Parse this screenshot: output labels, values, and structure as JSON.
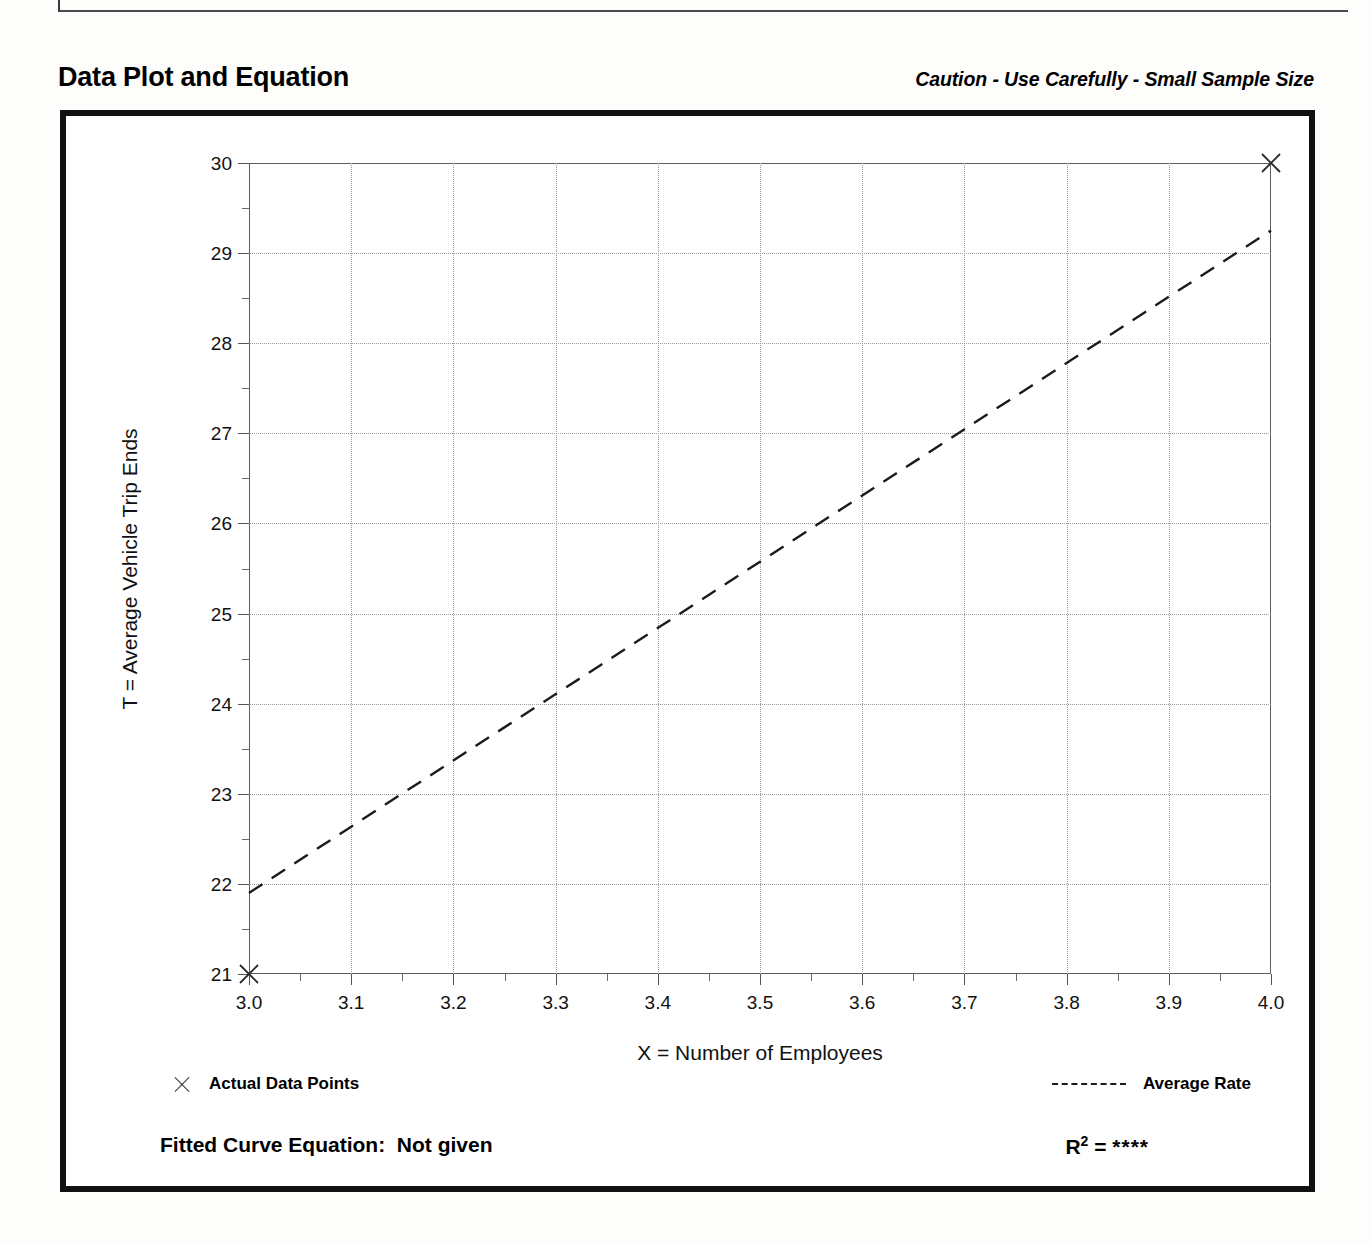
{
  "header": {
    "title": "Data Plot and Equation",
    "caution": "Caution - Use Carefully - Small Sample Size"
  },
  "legend": {
    "data_points_label": "Actual Data Points",
    "data_points_marker": "x-marker-icon",
    "average_rate_label": "Average Rate",
    "average_rate_marker": "dashed-line-icon"
  },
  "footer": {
    "equation_label": "Fitted Curve Equation:",
    "equation_value": "Not given",
    "r_symbol": "R",
    "r_exponent": "2",
    "r_equals": "=",
    "r_value": "****"
  },
  "chart_data": {
    "type": "scatter",
    "title": "Data Plot and Equation",
    "xlabel": "X = Number of Employees",
    "ylabel": "T = Average Vehicle Trip Ends",
    "xlim": [
      3.0,
      4.0
    ],
    "ylim": [
      21,
      30
    ],
    "grid": true,
    "x_ticks": [
      "3.0",
      "3.1",
      "3.2",
      "3.3",
      "3.4",
      "3.5",
      "3.6",
      "3.7",
      "3.8",
      "3.9",
      "4.0"
    ],
    "x_tick_values": [
      3.0,
      3.1,
      3.2,
      3.3,
      3.4,
      3.5,
      3.6,
      3.7,
      3.8,
      3.9,
      4.0
    ],
    "x_minor_step": 0.05,
    "y_ticks": [
      "21",
      "22",
      "23",
      "24",
      "25",
      "26",
      "27",
      "28",
      "29",
      "30"
    ],
    "y_tick_values": [
      21,
      22,
      23,
      24,
      25,
      26,
      27,
      28,
      29,
      30
    ],
    "y_minor_step": 0.5,
    "series": [
      {
        "name": "Actual Data Points",
        "type": "scatter",
        "marker": "x",
        "points": [
          {
            "x": 3.0,
            "y": 21.0
          },
          {
            "x": 4.0,
            "y": 30.0
          }
        ]
      },
      {
        "name": "Average Rate",
        "type": "line",
        "style": "dashed",
        "points": [
          {
            "x": 3.0,
            "y": 21.9
          },
          {
            "x": 4.0,
            "y": 29.25
          }
        ]
      }
    ],
    "legend_position": "below-axes"
  }
}
